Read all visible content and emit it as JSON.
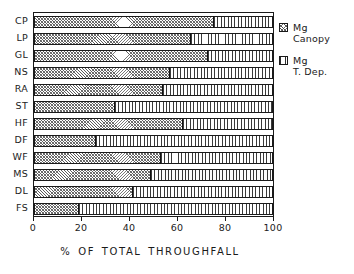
{
  "chart_data": {
    "type": "bar",
    "orientation": "horizontal",
    "stacked": true,
    "percent": true,
    "title": "",
    "subtitle": "",
    "xlabel": "% OF TOTAL THROUGHFALL",
    "ylabel": "",
    "xlim": [
      0,
      100
    ],
    "xticks": [
      0,
      20,
      40,
      60,
      80,
      100
    ],
    "xticklabels": [
      "0",
      "20",
      "40",
      "60",
      "80",
      "100"
    ],
    "grid": false,
    "legend_position": "right",
    "categories": [
      "CP",
      "LP",
      "GL",
      "NS",
      "RA",
      "ST",
      "HF",
      "DF",
      "WF",
      "MS",
      "DL",
      "FS"
    ],
    "series": [
      {
        "name": "Mg Canopy",
        "pattern": "diagonal-crosshatch",
        "values": [
          75.5,
          65.5,
          73.0,
          57.0,
          54.0,
          34.0,
          62.5,
          26.0,
          53.0,
          49.0,
          41.5,
          19.0
        ]
      },
      {
        "name": "Mg T. Dep.",
        "pattern": "vertical-lines",
        "values": [
          24.5,
          34.5,
          27.0,
          43.0,
          46.0,
          66.0,
          37.5,
          74.0,
          47.0,
          51.0,
          58.5,
          81.0
        ]
      }
    ],
    "legend": [
      {
        "line1": "Mg",
        "line2": "Canopy",
        "pattern": "diagonal-crosshatch"
      },
      {
        "line1": "Mg",
        "line2": "T. Dep.",
        "pattern": "vertical-lines"
      }
    ],
    "colors": {
      "axis": "#1a1a1a",
      "text": "#222222",
      "canopy_fill": "#5d5d5d",
      "tdep_fill": "#3a3a3a",
      "background": "#ffffff"
    }
  }
}
